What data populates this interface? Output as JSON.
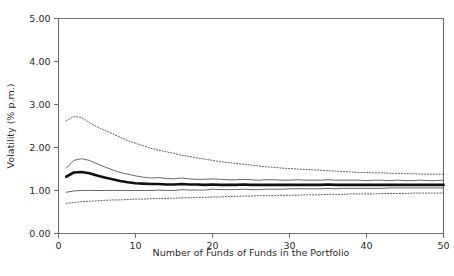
{
  "chart_data": {
    "type": "line",
    "title": "",
    "xlabel": "Number of Funds of Funds in the Portfolio",
    "ylabel": "Volatility (% p.m.)",
    "xlim": [
      0,
      50
    ],
    "ylim": [
      0,
      5
    ],
    "xticks": [
      "0",
      "10",
      "20",
      "30",
      "40",
      "50"
    ],
    "xtick_values": [
      0,
      10,
      20,
      30,
      40,
      50
    ],
    "yticks": [
      "0.00",
      "1.00",
      "2.00",
      "3.00",
      "4.00",
      "5.00"
    ],
    "ytick_values": [
      0,
      1,
      2,
      3,
      4,
      5
    ],
    "grid": false,
    "legend": "none",
    "x": [
      1,
      2,
      3,
      4,
      5,
      6,
      7,
      8,
      9,
      10,
      11,
      12,
      13,
      14,
      15,
      16,
      17,
      18,
      19,
      20,
      21,
      22,
      23,
      24,
      25,
      26,
      27,
      28,
      29,
      30,
      31,
      32,
      33,
      34,
      35,
      36,
      37,
      38,
      39,
      40,
      41,
      42,
      43,
      44,
      45,
      46,
      47,
      48,
      49,
      50
    ],
    "series": [
      {
        "name": "95th percentile",
        "style": "dotted",
        "color": "#4a4a4a",
        "values": [
          2.62,
          2.72,
          2.7,
          2.58,
          2.48,
          2.4,
          2.32,
          2.24,
          2.16,
          2.1,
          2.04,
          1.98,
          1.94,
          1.9,
          1.86,
          1.82,
          1.79,
          1.76,
          1.73,
          1.7,
          1.67,
          1.65,
          1.63,
          1.61,
          1.59,
          1.57,
          1.55,
          1.54,
          1.52,
          1.51,
          1.5,
          1.49,
          1.48,
          1.47,
          1.46,
          1.45,
          1.44,
          1.43,
          1.42,
          1.42,
          1.41,
          1.41,
          1.4,
          1.4,
          1.39,
          1.39,
          1.38,
          1.38,
          1.38,
          1.38
        ]
      },
      {
        "name": "75th percentile",
        "style": "solid-thin",
        "color": "#555555",
        "values": [
          1.52,
          1.7,
          1.74,
          1.7,
          1.62,
          1.55,
          1.48,
          1.42,
          1.38,
          1.34,
          1.31,
          1.29,
          1.3,
          1.28,
          1.27,
          1.29,
          1.27,
          1.26,
          1.26,
          1.27,
          1.26,
          1.25,
          1.25,
          1.26,
          1.25,
          1.24,
          1.25,
          1.25,
          1.24,
          1.24,
          1.25,
          1.24,
          1.24,
          1.24,
          1.25,
          1.24,
          1.24,
          1.24,
          1.24,
          1.23,
          1.24,
          1.24,
          1.23,
          1.24,
          1.23,
          1.23,
          1.24,
          1.23,
          1.23,
          1.24
        ]
      },
      {
        "name": "median",
        "style": "solid-thick",
        "color": "#111111",
        "values": [
          1.32,
          1.42,
          1.43,
          1.4,
          1.35,
          1.3,
          1.26,
          1.22,
          1.19,
          1.17,
          1.16,
          1.15,
          1.15,
          1.14,
          1.14,
          1.15,
          1.14,
          1.14,
          1.13,
          1.14,
          1.13,
          1.13,
          1.13,
          1.14,
          1.13,
          1.13,
          1.13,
          1.13,
          1.13,
          1.13,
          1.13,
          1.13,
          1.13,
          1.13,
          1.14,
          1.13,
          1.13,
          1.13,
          1.13,
          1.13,
          1.13,
          1.13,
          1.13,
          1.13,
          1.13,
          1.13,
          1.13,
          1.13,
          1.13,
          1.13
        ]
      },
      {
        "name": "25th percentile",
        "style": "solid-thin",
        "color": "#555555",
        "values": [
          0.96,
          0.99,
          1.0,
          1.0,
          1.0,
          1.0,
          1.0,
          1.0,
          1.0,
          1.0,
          1.0,
          1.0,
          1.01,
          1.0,
          1.0,
          1.02,
          1.01,
          1.01,
          1.01,
          1.03,
          1.02,
          1.02,
          1.02,
          1.03,
          1.02,
          1.02,
          1.03,
          1.03,
          1.03,
          1.04,
          1.04,
          1.04,
          1.04,
          1.04,
          1.05,
          1.04,
          1.05,
          1.05,
          1.05,
          1.05,
          1.05,
          1.05,
          1.06,
          1.06,
          1.06,
          1.06,
          1.06,
          1.06,
          1.06,
          1.06
        ]
      },
      {
        "name": "5th percentile",
        "style": "dotted",
        "color": "#4a4a4a",
        "values": [
          0.7,
          0.72,
          0.74,
          0.75,
          0.76,
          0.77,
          0.78,
          0.78,
          0.79,
          0.8,
          0.8,
          0.81,
          0.81,
          0.82,
          0.82,
          0.83,
          0.83,
          0.84,
          0.84,
          0.85,
          0.85,
          0.86,
          0.86,
          0.87,
          0.87,
          0.88,
          0.88,
          0.88,
          0.89,
          0.89,
          0.89,
          0.9,
          0.9,
          0.9,
          0.91,
          0.91,
          0.91,
          0.92,
          0.92,
          0.92,
          0.92,
          0.93,
          0.93,
          0.93,
          0.93,
          0.94,
          0.94,
          0.94,
          0.94,
          0.94
        ]
      }
    ]
  }
}
